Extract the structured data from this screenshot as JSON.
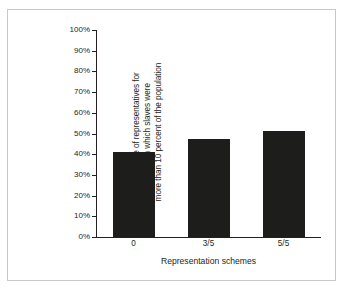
{
  "chart_data": {
    "type": "bar",
    "title": "",
    "subtitle": "",
    "xlabel": "Representation schemes",
    "ylabel": "Percentage of representatives for states in which slaves were more than 10 percent of the population",
    "ylabel_lines": [
      "Percentage of representatives for",
      "states in which slaves were",
      "more than 10 percent of the population"
    ],
    "categories": [
      "0",
      "3/5",
      "5/5"
    ],
    "values": [
      41,
      47.5,
      51
    ],
    "series": [
      {
        "name": "Percentage of representatives",
        "values": [
          41,
          47.5,
          51
        ]
      }
    ],
    "ylim": [
      0,
      100
    ],
    "ytick_values": [
      0,
      10,
      20,
      30,
      40,
      50,
      60,
      70,
      80,
      90,
      100
    ],
    "ytick_labels": [
      "0%",
      "10%",
      "20%",
      "30%",
      "40%",
      "50%",
      "60%",
      "70%",
      "80%",
      "90%",
      "100%"
    ],
    "grid": false,
    "legend": "none",
    "bar_color": "#1d1d1b",
    "axis_color": "#231f20",
    "background_color": "#ffffff",
    "frame_color": "#c9c9c9"
  }
}
